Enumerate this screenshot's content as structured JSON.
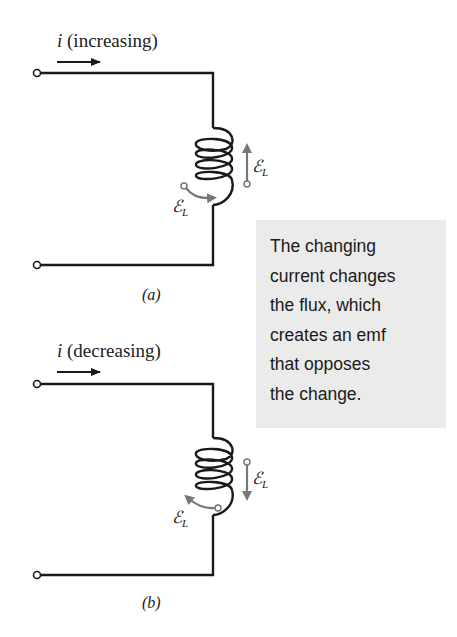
{
  "diagram": {
    "panel_a": {
      "current_symbol": "i",
      "current_state": "(increasing)",
      "caption": "(a)",
      "emf_label_symbol": "ℰ",
      "emf_label_sub": "L",
      "emf_direction": "up"
    },
    "panel_b": {
      "current_symbol": "i",
      "current_state": "(decreasing)",
      "caption": "(b)",
      "emf_label_symbol": "ℰ",
      "emf_label_sub": "L",
      "emf_direction": "down"
    },
    "callout": {
      "lines": [
        "The changing",
        "current changes",
        "the flux, which",
        "creates an emf",
        "that opposes",
        "the change."
      ],
      "background": "#ebebeb"
    },
    "colors": {
      "wire": "#1a1a1a",
      "emf_arrow": "#777777"
    }
  }
}
